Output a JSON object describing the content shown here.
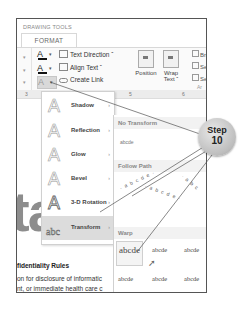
{
  "ribbon": {
    "context_label": "DRAWING TOOLS",
    "active_tab": "FORMAT",
    "text_group": {
      "text_fill_glyph": "A",
      "text_outline_glyph": "A",
      "text_effects_glyph": "A",
      "text_direction": "Text Direction ˇ",
      "align_text": "Align Text ˇ",
      "create_link": "Create Link"
    },
    "arrange_group": {
      "position": "Position",
      "wrap_text": "Wrap Text ˇ",
      "bring_forward": "Brin",
      "send_backward": "Sen",
      "selection_pane": "Sele",
      "group_label": "Ar"
    }
  },
  "ruler": {
    "ticks": [
      "3",
      "5",
      "6"
    ]
  },
  "text_effects_menu": {
    "items": [
      {
        "label": "Shadow",
        "glyph": "A"
      },
      {
        "label": "Reflection",
        "glyph": "A"
      },
      {
        "label": "Glow",
        "glyph": "A"
      },
      {
        "label": "Bevel",
        "glyph": "A"
      },
      {
        "label": "3-D Rotation",
        "glyph": "A"
      },
      {
        "label": "Transform",
        "glyph": "abc",
        "highlighted": true
      }
    ],
    "submenu_arrow": "›"
  },
  "transform_submenu": {
    "no_transform_header": "No Transform",
    "no_transform_sample": "abcde",
    "follow_path_header": "Follow Path",
    "follow_path_samples": [
      "· a b c d e ·",
      "· a b c d e ·",
      "· a b c"
    ],
    "warp_header": "Warp",
    "warp_row1": [
      "abcde",
      "abcde",
      "abcde"
    ],
    "warp_row2": [
      "abcde",
      "abcde",
      "abcde"
    ]
  },
  "document": {
    "large_text": "ta",
    "heading": "fidentiality Rules",
    "lines": [
      "on for disclosure of informatic",
      "nt, or immediate health care c",
      "subject to restrictions where p"
    ]
  },
  "callout": {
    "line1": "Step",
    "line2": "10"
  },
  "colors": {
    "callout_fill": "#bdbdbd",
    "menu_highlight": "#dcdcdc",
    "frame_border": "#555555"
  }
}
